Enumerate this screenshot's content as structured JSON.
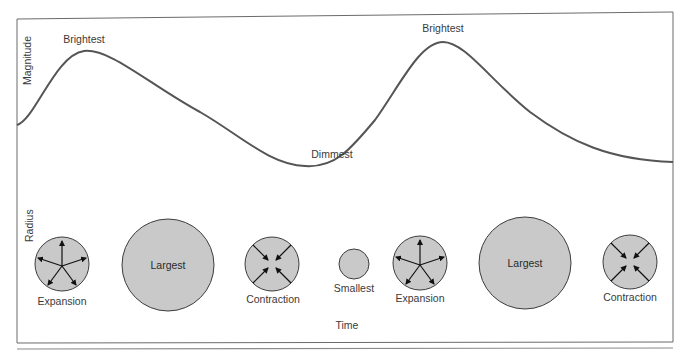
{
  "diagram": {
    "axes": {
      "top_label": "Magnitude",
      "bottom_label": "Radius",
      "x_label": "Time"
    },
    "curve_labels": {
      "peak1": "Brightest",
      "minimum": "Dimmest",
      "peak2": "Brightest"
    },
    "stages": [
      {
        "label": "Expansion",
        "type": "expansion"
      },
      {
        "label": "Largest",
        "type": "largest"
      },
      {
        "label": "Contraction",
        "type": "contraction"
      },
      {
        "label": "Smallest",
        "type": "smallest"
      },
      {
        "label": "Expansion",
        "type": "expansion"
      },
      {
        "label": "Largest",
        "type": "largest"
      },
      {
        "label": "Contraction",
        "type": "contraction"
      }
    ],
    "colors": {
      "frame": "#6b6b6b",
      "curve": "#555555",
      "circle_fill": "#c9c9c9",
      "circle_stroke": "#3d3d3d",
      "text": "#3a3a3a"
    }
  }
}
